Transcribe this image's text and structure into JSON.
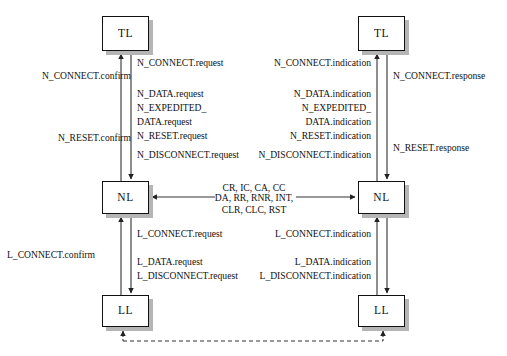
{
  "diagram": {
    "nodes": [
      {
        "id": "tl-left",
        "label": "TL",
        "x": 102,
        "y": 16,
        "w": 47,
        "h": 35
      },
      {
        "id": "tl-right",
        "label": "TL",
        "x": 358,
        "y": 16,
        "w": 47,
        "h": 35
      },
      {
        "id": "nl-left",
        "label": "NL",
        "x": 102,
        "y": 181,
        "w": 47,
        "h": 33
      },
      {
        "id": "nl-right",
        "label": "NL",
        "x": 358,
        "y": 181,
        "w": 47,
        "h": 33
      },
      {
        "id": "ll-left",
        "label": "LL",
        "x": 102,
        "y": 295,
        "w": 47,
        "h": 32
      },
      {
        "id": "ll-right",
        "label": "LL",
        "x": 358,
        "y": 295,
        "w": 47,
        "h": 32
      }
    ],
    "labels": {
      "left_upper_outer": [
        {
          "text": "N_CONNECT.confirm",
          "x": 131,
          "y": 70,
          "align": "r"
        },
        {
          "text": "N_RESET.confirm",
          "x": 131,
          "y": 132,
          "align": "r"
        }
      ],
      "left_upper_inner": [
        {
          "text": "N_CONNECT.request",
          "x": 137,
          "y": 57,
          "align": "l"
        },
        {
          "text": "N_DATA.request",
          "x": 137,
          "y": 88,
          "align": "l"
        },
        {
          "text": "N_EXPEDITED_",
          "x": 137,
          "y": 102,
          "align": "l"
        },
        {
          "text": "DATA.request",
          "x": 137,
          "y": 116,
          "align": "l"
        },
        {
          "text": "N_RESET.request",
          "x": 137,
          "y": 130,
          "align": "l"
        },
        {
          "text": "N_DISCONNECT.request",
          "x": 137,
          "y": 149,
          "align": "l"
        }
      ],
      "right_upper_inner": [
        {
          "text": "N_CONNECT.indication",
          "x": 371,
          "y": 57,
          "align": "r"
        },
        {
          "text": "N_DATA.indication",
          "x": 371,
          "y": 88,
          "align": "r"
        },
        {
          "text": "N_EXPEDITED_",
          "x": 371,
          "y": 102,
          "align": "r"
        },
        {
          "text": "DATA.indication",
          "x": 371,
          "y": 116,
          "align": "r"
        },
        {
          "text": "N_RESET.indication",
          "x": 371,
          "y": 130,
          "align": "r"
        },
        {
          "text": "N_DISCONNECT.indication",
          "x": 371,
          "y": 149,
          "align": "r"
        }
      ],
      "right_upper_outer": [
        {
          "text": "N_CONNECT.response",
          "x": 393,
          "y": 70,
          "align": "l"
        },
        {
          "text": "N_RESET.response",
          "x": 393,
          "y": 142,
          "align": "l"
        }
      ],
      "center": [
        {
          "text": "CR, IC, CA, CC",
          "x": 254,
          "y": 182,
          "align": "c"
        },
        {
          "text": "DA, RR, RNR, INT,",
          "x": 254,
          "y": 192,
          "align": "c"
        },
        {
          "text": "CLR, CLC, RST",
          "x": 254,
          "y": 204,
          "align": "c"
        }
      ],
      "left_lower_outer": [
        {
          "text": "L_CONNECT.confirm",
          "x": 95,
          "y": 249,
          "align": "r"
        }
      ],
      "left_lower_inner": [
        {
          "text": "L_CONNECT.request",
          "x": 137,
          "y": 228,
          "align": "l"
        },
        {
          "text": "L_DATA.request",
          "x": 137,
          "y": 256,
          "align": "l"
        },
        {
          "text": "L_DISCONNECT.request",
          "x": 137,
          "y": 270,
          "align": "l"
        }
      ],
      "right_lower_inner": [
        {
          "text": "L_CONNECT.indication",
          "x": 371,
          "y": 228,
          "align": "r"
        },
        {
          "text": "L_DATA.indication",
          "x": 371,
          "y": 256,
          "align": "r"
        },
        {
          "text": "L_DISCONNECT.indication",
          "x": 371,
          "y": 270,
          "align": "r"
        }
      ]
    },
    "colors": {
      "line": "#333333",
      "box_border": "#111111",
      "shadow": "#b5b5b5",
      "background": "#ffffff"
    }
  }
}
